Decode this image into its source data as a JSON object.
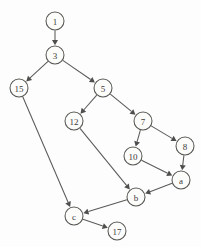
{
  "diagram": {
    "type": "directed-graph",
    "style": {
      "background_color": "#fdfdfd",
      "node_fill": "#fcfcfb",
      "node_stroke": "#575754",
      "edge_color": "#5a5a58",
      "label_color": "#3a3a38",
      "node_radius": 9
    },
    "nodes": [
      {
        "id": "n1",
        "label": "1",
        "x": 55,
        "y": 21
      },
      {
        "id": "n3",
        "label": "3",
        "x": 55,
        "y": 55
      },
      {
        "id": "n15",
        "label": "15",
        "x": 19,
        "y": 88
      },
      {
        "id": "n5",
        "label": "5",
        "x": 103,
        "y": 88
      },
      {
        "id": "n12",
        "label": "12",
        "x": 74,
        "y": 121
      },
      {
        "id": "n7",
        "label": "7",
        "x": 143,
        "y": 121
      },
      {
        "id": "n8",
        "label": "8",
        "x": 185,
        "y": 146
      },
      {
        "id": "n10",
        "label": "10",
        "x": 133,
        "y": 156
      },
      {
        "id": "na",
        "label": "a",
        "x": 181,
        "y": 180
      },
      {
        "id": "nb",
        "label": "b",
        "x": 136,
        "y": 197
      },
      {
        "id": "nc",
        "label": "c",
        "x": 74,
        "y": 216
      },
      {
        "id": "n17",
        "label": "17",
        "x": 117,
        "y": 231
      }
    ],
    "edges": [
      {
        "id": "e1",
        "from": "n1",
        "to": "n3",
        "from_label": "1",
        "to_label": "3"
      },
      {
        "id": "e2",
        "from": "n3",
        "to": "n15",
        "from_label": "3",
        "to_label": "15"
      },
      {
        "id": "e3",
        "from": "n3",
        "to": "n5",
        "from_label": "3",
        "to_label": "5"
      },
      {
        "id": "e4",
        "from": "n5",
        "to": "n12",
        "from_label": "5",
        "to_label": "12"
      },
      {
        "id": "e5",
        "from": "n5",
        "to": "n7",
        "from_label": "5",
        "to_label": "7"
      },
      {
        "id": "e6",
        "from": "n7",
        "to": "n10",
        "from_label": "7",
        "to_label": "10"
      },
      {
        "id": "e7",
        "from": "n7",
        "to": "n8",
        "from_label": "7",
        "to_label": "8"
      },
      {
        "id": "e8",
        "from": "n8",
        "to": "na",
        "from_label": "8",
        "to_label": "a"
      },
      {
        "id": "e9",
        "from": "n10",
        "to": "na",
        "from_label": "10",
        "to_label": "a"
      },
      {
        "id": "e10",
        "from": "na",
        "to": "nb",
        "from_label": "a",
        "to_label": "b"
      },
      {
        "id": "e11",
        "from": "n12",
        "to": "nb",
        "from_label": "12",
        "to_label": "b"
      },
      {
        "id": "e12",
        "from": "nb",
        "to": "nc",
        "from_label": "b",
        "to_label": "c"
      },
      {
        "id": "e13",
        "from": "n15",
        "to": "nc",
        "from_label": "15",
        "to_label": "c"
      },
      {
        "id": "e14",
        "from": "nc",
        "to": "n17",
        "from_label": "c",
        "to_label": "17"
      }
    ]
  }
}
